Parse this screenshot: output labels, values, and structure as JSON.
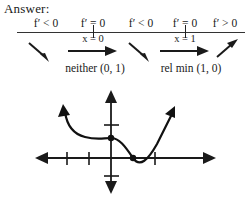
{
  "heading": {
    "answer_label": "Answer:"
  },
  "sign_chart": {
    "intervals": [
      {
        "sign_text": "f′ < 0",
        "direction": "down-right"
      },
      {
        "sign_text": "f′ = 0",
        "direction": "right"
      },
      {
        "sign_text": "f′ < 0",
        "direction": "down-right"
      },
      {
        "sign_text": "f′ = 0",
        "direction": "right"
      },
      {
        "sign_text": "f′ > 0",
        "direction": "up-right"
      }
    ],
    "critical_points": [
      {
        "label": "x = 0"
      },
      {
        "label": "x = 1"
      }
    ],
    "conclusions": [
      {
        "text": "neither (0, 1)"
      },
      {
        "text": "rel min (1, 0)"
      }
    ]
  },
  "graph": {
    "description": "curve with flat inflection at (0, 1) and relative minimum at (1, 0)",
    "x_axis_label": "",
    "y_axis_label": "",
    "marked_points": [
      {
        "x": 0,
        "y": 1
      },
      {
        "x": 1,
        "y": 0
      }
    ],
    "x_ticks": [
      -3,
      -2,
      -1,
      1,
      2
    ],
    "y_ticks": [
      -1,
      1
    ]
  },
  "colors": {
    "ink": "#1a1a1a",
    "line": "#333333",
    "curve": "#111111",
    "background": "#ffffff"
  }
}
